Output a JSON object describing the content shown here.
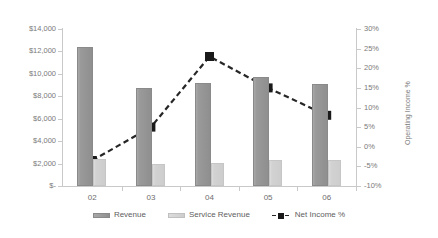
{
  "chart_data": {
    "type": "bar",
    "title": "",
    "xlabel": "",
    "ylabel": "$millions",
    "y2label": "Operating Income %",
    "categories": [
      "02",
      "03",
      "04",
      "05",
      "06"
    ],
    "series": [
      {
        "name": "Revenue",
        "axis": "left",
        "type": "bar",
        "color": "#9a9a9a",
        "values": [
          12400,
          8700,
          9200,
          9700,
          9100
        ]
      },
      {
        "name": "Service Revenue",
        "axis": "left",
        "type": "bar",
        "color": "#d4d4d4",
        "values": [
          2450,
          2000,
          2050,
          2350,
          2300
        ]
      },
      {
        "name": "Net Income %",
        "axis": "right",
        "type": "line",
        "color": "#1a1a1a",
        "values": [
          -3.5,
          5,
          23,
          15,
          8
        ]
      }
    ],
    "ylim": [
      0,
      14000
    ],
    "y2lim": [
      -10,
      30
    ],
    "yticks": [
      0,
      2000,
      4000,
      6000,
      8000,
      10000,
      12000,
      14000
    ],
    "ytick_labels": [
      "$-",
      "$2,000",
      "$4,000",
      "$6,000",
      "$8,000",
      "$10,000",
      "$12,000",
      "$14,000"
    ],
    "y2ticks": [
      -10,
      -5,
      0,
      5,
      10,
      15,
      20,
      25,
      30
    ],
    "y2tick_labels": [
      "-10%",
      "-5%",
      "0%",
      "5%",
      "10%",
      "15%",
      "20%",
      "25%",
      "30%"
    ],
    "grid": false,
    "legend_position": "bottom",
    "legend": [
      "Revenue",
      "Service Revenue",
      "Net Income %"
    ]
  }
}
